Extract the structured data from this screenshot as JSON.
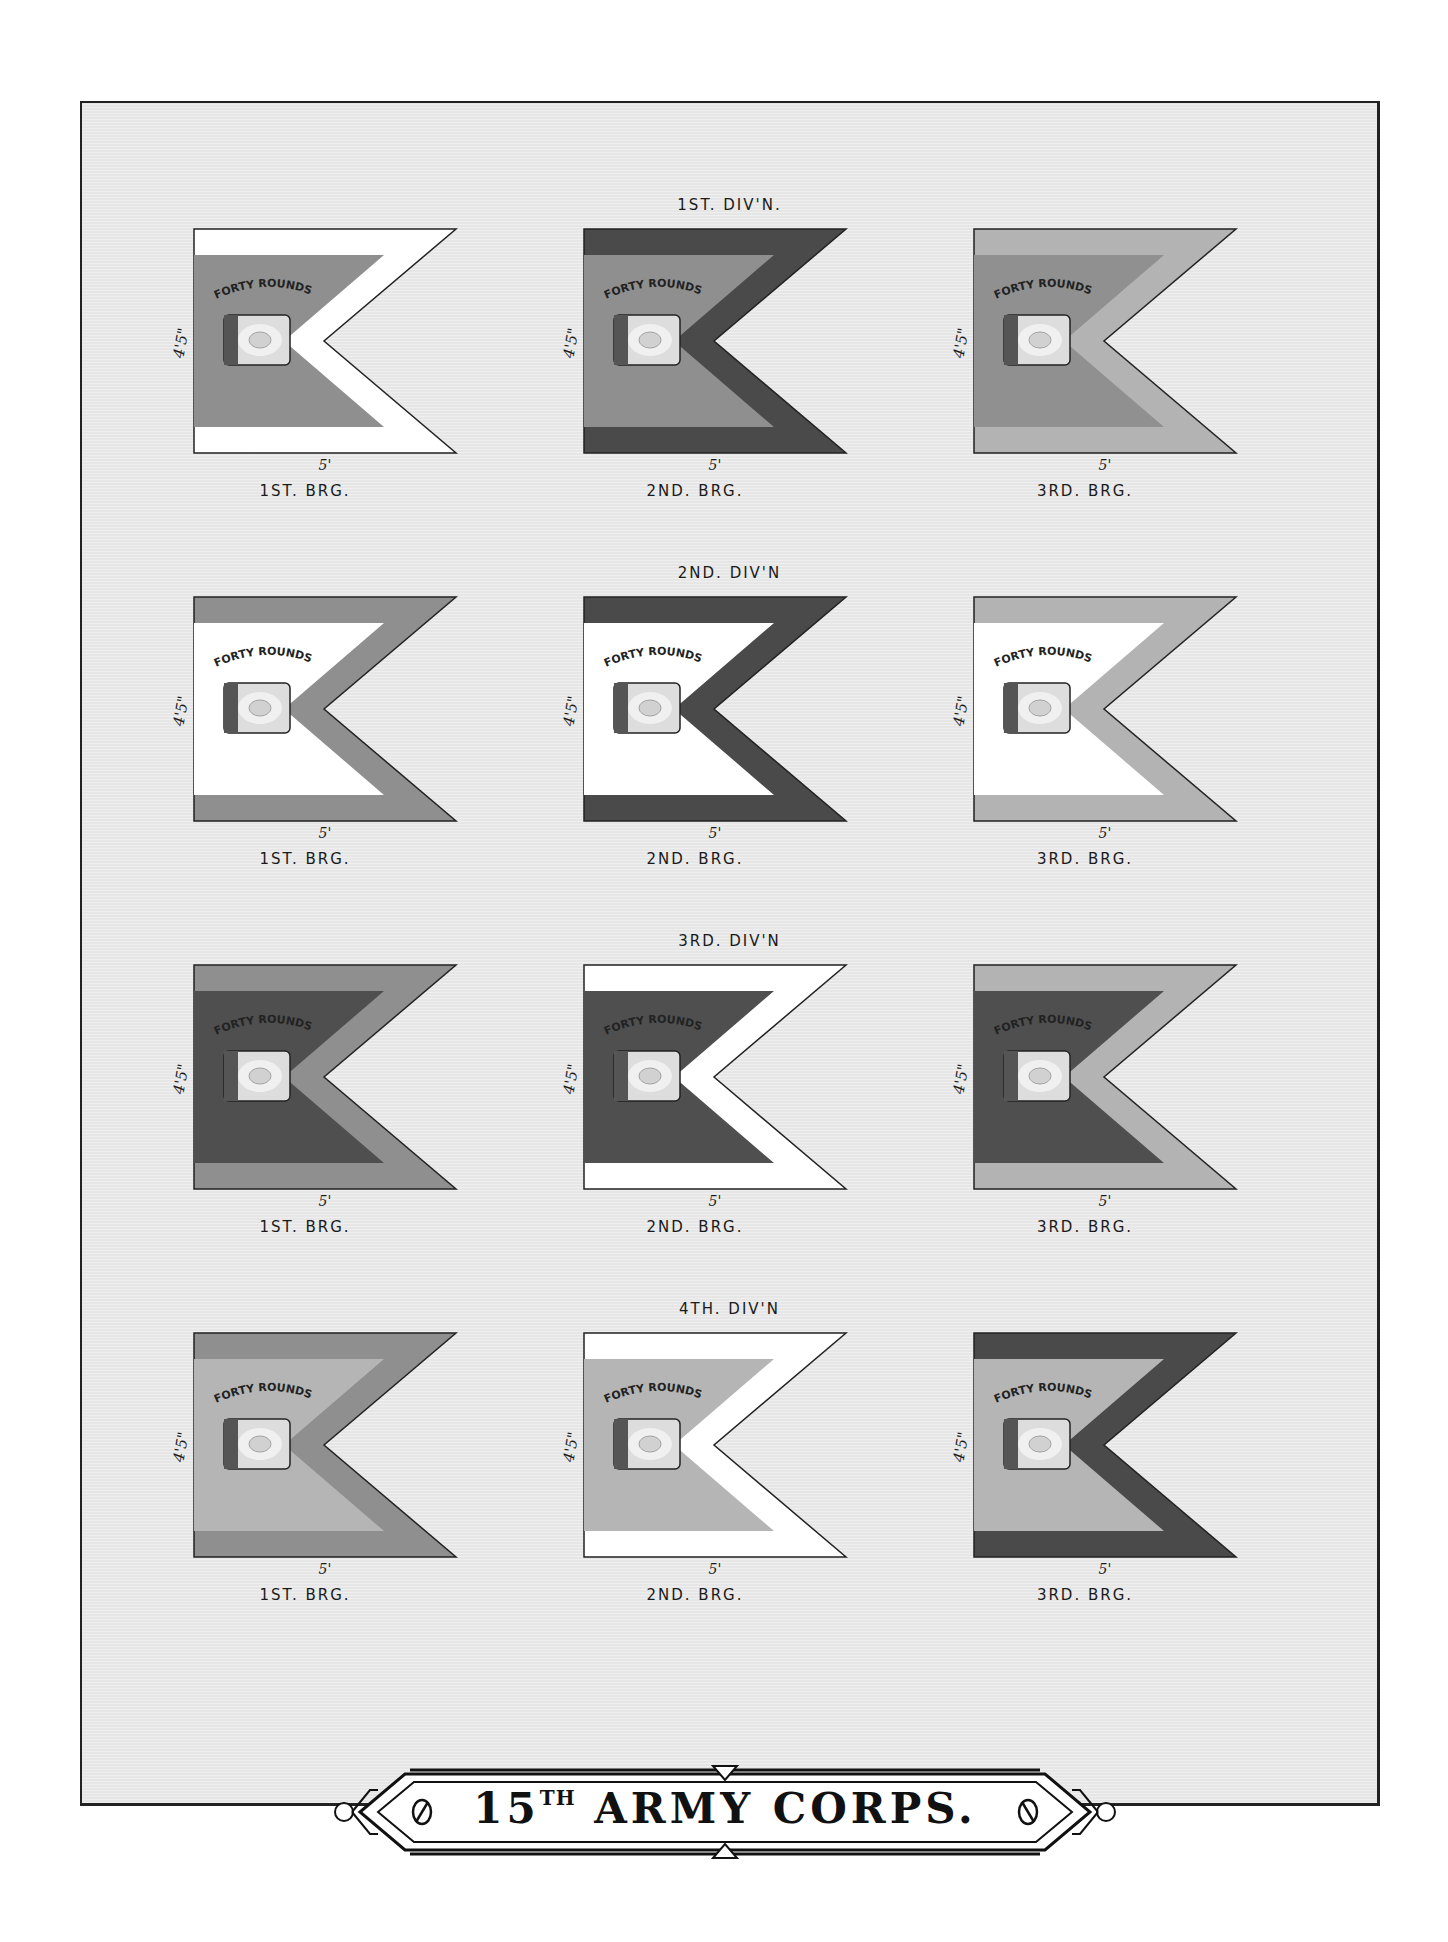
{
  "plate": {
    "title_number": "15",
    "title_suffix": "TH",
    "title_text": "ARMY CORPS.",
    "background": "#e6e6e6",
    "frame_color": "#222222"
  },
  "legend_text": {
    "motto": "FORTY ROUNDS",
    "height_dim": "4'5\"",
    "width_dim": "5'"
  },
  "colors": {
    "white": "#ffffff",
    "red_mid": "#8f8f8f",
    "blue_dark": "#4a4a4a",
    "light_gray": "#b5b5b5",
    "mid_light": "#a8a8a8"
  },
  "divisions": [
    {
      "label": "1ST. DIV'N.",
      "brigades": [
        {
          "label": "1ST. BRG.",
          "field": "#8f8f8f",
          "border": "#ffffff"
        },
        {
          "label": "2ND. BRG.",
          "field": "#8f8f8f",
          "border": "#4a4a4a"
        },
        {
          "label": "3RD. BRG.",
          "field": "#909090",
          "border": "#b3b3b3"
        }
      ]
    },
    {
      "label": "2ND. DIV'N",
      "brigades": [
        {
          "label": "1ST. BRG.",
          "field": "#ffffff",
          "border": "#8f8f8f"
        },
        {
          "label": "2ND. BRG.",
          "field": "#ffffff",
          "border": "#4a4a4a"
        },
        {
          "label": "3RD. BRG.",
          "field": "#ffffff",
          "border": "#b3b3b3"
        }
      ]
    },
    {
      "label": "3RD. DIV'N",
      "brigades": [
        {
          "label": "1ST. BRG.",
          "field": "#4f4f4f",
          "border": "#8f8f8f"
        },
        {
          "label": "2ND. BRG.",
          "field": "#4f4f4f",
          "border": "#ffffff"
        },
        {
          "label": "3RD. BRG.",
          "field": "#4f4f4f",
          "border": "#b3b3b3"
        }
      ]
    },
    {
      "label": "4TH. DIV'N",
      "brigades": [
        {
          "label": "1ST. BRG.",
          "field": "#b5b5b5",
          "border": "#8f8f8f"
        },
        {
          "label": "2ND. BRG.",
          "field": "#b5b5b5",
          "border": "#ffffff"
        },
        {
          "label": "3RD. BRG.",
          "field": "#b5b5b5",
          "border": "#4a4a4a"
        }
      ]
    }
  ]
}
